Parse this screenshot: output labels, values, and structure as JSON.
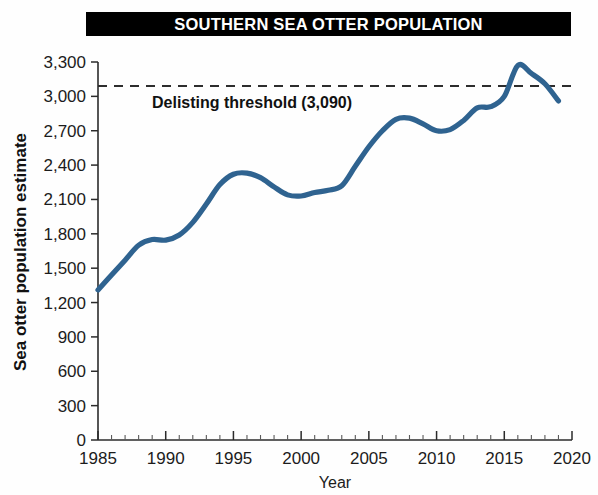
{
  "title": "SOUTHERN SEA OTTER POPULATION",
  "chart_data": {
    "type": "line",
    "title": "SOUTHERN SEA OTTER POPULATION",
    "xlabel": "Year",
    "ylabel": "Sea otter population estimate",
    "xlim": [
      1985,
      2020
    ],
    "ylim": [
      0,
      3300
    ],
    "grid": false,
    "legend": "none",
    "x_ticks": [
      1985,
      1990,
      1995,
      2000,
      2005,
      2010,
      2015,
      2020
    ],
    "x_tick_labels": [
      "1985",
      "1990",
      "1995",
      "2000",
      "2005",
      "2010",
      "2015",
      "2020"
    ],
    "x_minor_tick_step": 1,
    "y_ticks": [
      0,
      300,
      600,
      900,
      1200,
      1500,
      1800,
      2100,
      2400,
      2700,
      3000,
      3300
    ],
    "y_tick_labels": [
      "0",
      "300",
      "600",
      "900",
      "1,200",
      "1,500",
      "1,800",
      "2,100",
      "2,400",
      "2,700",
      "3,000",
      "3,300"
    ],
    "series": [
      {
        "name": "Sea otter population estimate",
        "color": "#2f6390",
        "x": [
          1985,
          1986,
          1987,
          1988,
          1989,
          1990,
          1991,
          1992,
          1993,
          1994,
          1995,
          1996,
          1997,
          1998,
          1999,
          2000,
          2001,
          2002,
          2003,
          2004,
          2005,
          2006,
          2007,
          2008,
          2009,
          2010,
          2011,
          2012,
          2013,
          2014,
          2015,
          2016,
          2017,
          2018,
          2019
        ],
        "values": [
          1310,
          1440,
          1570,
          1700,
          1750,
          1745,
          1790,
          1900,
          2060,
          2230,
          2320,
          2330,
          2290,
          2210,
          2140,
          2130,
          2160,
          2180,
          2220,
          2390,
          2560,
          2700,
          2800,
          2810,
          2760,
          2700,
          2710,
          2790,
          2900,
          2910,
          3000,
          3270,
          3200,
          3110,
          2960
        ]
      }
    ],
    "annotations": [
      {
        "name": "delisting-threshold",
        "label": "Delisting threshold (3,090)",
        "value": 3090,
        "style": "dashed-horizontal-line",
        "color": "#2d2d2d"
      }
    ]
  }
}
